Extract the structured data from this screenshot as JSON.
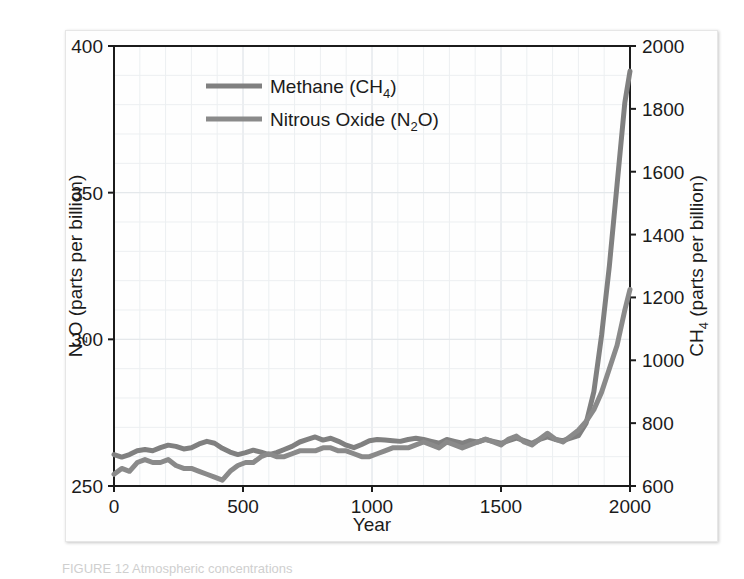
{
  "caption": "FIGURE 12   Atmospheric concentrations",
  "colors": {
    "methane_line": "#808080",
    "nitrous_line": "#8a8a8a",
    "axis": "#1b1b1b",
    "grid_minor": "#eceff1",
    "grid_major": "#e2e6ea",
    "text": "#1b1b1b"
  },
  "legend": {
    "position": "top-center",
    "items": [
      {
        "label_main": "Methane (CH",
        "label_sub": "4",
        "label_tail": ")",
        "full": "Methane (CH4)",
        "color": "#808080"
      },
      {
        "label_main": "Nitrous Oxide (N",
        "label_sub": "2",
        "label_tail": "O)",
        "full": "Nitrous Oxide (N2O)",
        "color": "#8a8a8a"
      }
    ]
  },
  "axes": {
    "x": {
      "label": "Year",
      "ticks": [
        "0",
        "500",
        "1000",
        "1500",
        "2000"
      ],
      "tick_values": [
        0,
        500,
        1000,
        1500,
        2000
      ],
      "minor_step": 100,
      "range": [
        0,
        2000
      ]
    },
    "y_left": {
      "label_main": "N",
      "label_sub": "2",
      "label_tail": "O (parts per billion)",
      "full": "N2O (parts per billion)",
      "ticks": [
        "250",
        "300",
        "350",
        "400"
      ],
      "tick_values": [
        250,
        300,
        350,
        400
      ],
      "minor_step": 10,
      "range": [
        250,
        400
      ]
    },
    "y_right": {
      "label_main": "CH",
      "label_sub": "4",
      "label_tail": " (parts per billion)",
      "full": "CH4 (parts per billion)",
      "ticks": [
        "600",
        "800",
        "1000",
        "1200",
        "1400",
        "1600",
        "1800",
        "2000"
      ],
      "tick_values": [
        600,
        800,
        1000,
        1200,
        1400,
        1600,
        1800,
        2000
      ],
      "minor_step": 50,
      "range": [
        600,
        2000
      ]
    }
  },
  "chart_data": {
    "type": "line",
    "title": "",
    "xlabel": "Year",
    "ylabel": "N2O (parts per billion)",
    "ylabel_secondary": "CH4 (parts per billion)",
    "xlim": [
      0,
      2000
    ],
    "ylim": [
      250,
      400
    ],
    "ylim_secondary": [
      600,
      2000
    ],
    "grid": true,
    "legend_position": "top-center",
    "series": [
      {
        "name": "Methane (CH4)",
        "axis": "right",
        "units": "parts per billion",
        "color": "#808080",
        "x": [
          0,
          30,
          60,
          90,
          120,
          150,
          180,
          210,
          240,
          270,
          300,
          330,
          360,
          390,
          420,
          450,
          480,
          510,
          540,
          570,
          600,
          630,
          660,
          690,
          720,
          750,
          780,
          810,
          840,
          870,
          900,
          930,
          960,
          990,
          1020,
          1050,
          1080,
          1110,
          1140,
          1170,
          1200,
          1230,
          1260,
          1290,
          1320,
          1350,
          1380,
          1410,
          1440,
          1470,
          1500,
          1530,
          1560,
          1590,
          1620,
          1650,
          1680,
          1710,
          1740,
          1770,
          1800,
          1830,
          1860,
          1890,
          1920,
          1950,
          1980,
          2000
        ],
        "y": [
          700,
          692,
          700,
          712,
          716,
          712,
          722,
          730,
          726,
          718,
          722,
          734,
          742,
          736,
          720,
          708,
          700,
          706,
          714,
          708,
          700,
          706,
          716,
          726,
          740,
          748,
          756,
          746,
          752,
          742,
          730,
          722,
          732,
          744,
          748,
          746,
          744,
          742,
          748,
          752,
          748,
          742,
          736,
          748,
          742,
          736,
          744,
          740,
          748,
          742,
          736,
          744,
          752,
          744,
          736,
          748,
          756,
          748,
          744,
          752,
          760,
          800,
          900,
          1080,
          1300,
          1560,
          1820,
          1920
        ]
      },
      {
        "name": "Nitrous Oxide (N2O)",
        "axis": "left",
        "units": "parts per billion",
        "color": "#8a8a8a",
        "x": [
          0,
          30,
          60,
          90,
          120,
          150,
          180,
          210,
          240,
          270,
          300,
          330,
          360,
          390,
          420,
          450,
          480,
          510,
          540,
          570,
          600,
          630,
          660,
          690,
          720,
          750,
          780,
          810,
          840,
          870,
          900,
          930,
          960,
          990,
          1020,
          1050,
          1080,
          1110,
          1140,
          1170,
          1200,
          1230,
          1260,
          1290,
          1320,
          1350,
          1380,
          1410,
          1440,
          1470,
          1500,
          1530,
          1560,
          1590,
          1620,
          1650,
          1680,
          1710,
          1740,
          1770,
          1800,
          1830,
          1860,
          1890,
          1920,
          1950,
          1980,
          2000
        ],
        "y": [
          254,
          256,
          255,
          258,
          259,
          258,
          258,
          259,
          257,
          256,
          256,
          255,
          254,
          253,
          252,
          255,
          257,
          258,
          258,
          260,
          261,
          260,
          260,
          261,
          262,
          262,
          262,
          263,
          263,
          262,
          262,
          261,
          260,
          260,
          261,
          262,
          263,
          263,
          263,
          264,
          265,
          264,
          263,
          265,
          264,
          263,
          264,
          265,
          266,
          265,
          264,
          266,
          267,
          265,
          264,
          266,
          268,
          266,
          265,
          267,
          269,
          272,
          276,
          282,
          290,
          298,
          310,
          317
        ]
      }
    ]
  }
}
